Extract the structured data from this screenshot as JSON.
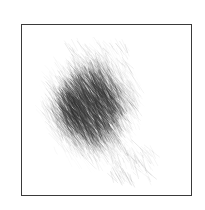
{
  "artwork": {
    "title": "Pencil Scribble Sketch",
    "medium": "graphite-hatching",
    "canvas": {
      "width": 205,
      "height": 210,
      "background_color": "#ffffff"
    },
    "frame": {
      "x": 21,
      "y": 24,
      "width": 171,
      "height": 172,
      "border_width": 1,
      "border_color": "#3a3a3a",
      "fill_color": "#ffffff"
    },
    "scribble": {
      "name": "diagonal-hatch-mass",
      "stroke_color": "#2e2e2e",
      "darkest_value": "#4a4a4a",
      "lightest_value": "#f2f2f2",
      "stroke_angle_degrees": 58,
      "stroke_count": 2600,
      "stroke_length_min": 5,
      "stroke_length_max": 26,
      "stroke_width": 0.45,
      "bounds": {
        "x_min": 42,
        "x_max": 152,
        "y_min": 44,
        "y_max": 180
      },
      "core": {
        "center_x": 88,
        "center_y": 108,
        "radius_x": 36,
        "radius_y": 46,
        "rotation_degrees": 28
      },
      "density_nodes": [
        {
          "x": 84,
          "y": 100,
          "radius": 30,
          "weight": 1.0
        },
        {
          "x": 74,
          "y": 114,
          "radius": 22,
          "weight": 0.95
        },
        {
          "x": 100,
          "y": 88,
          "radius": 26,
          "weight": 0.72
        },
        {
          "x": 110,
          "y": 118,
          "radius": 26,
          "weight": 0.66
        },
        {
          "x": 96,
          "y": 140,
          "radius": 24,
          "weight": 0.58
        },
        {
          "x": 120,
          "y": 146,
          "radius": 20,
          "weight": 0.42
        },
        {
          "x": 92,
          "y": 66,
          "radius": 22,
          "weight": 0.36
        },
        {
          "x": 124,
          "y": 96,
          "radius": 22,
          "weight": 0.34
        },
        {
          "x": 136,
          "y": 132,
          "radius": 16,
          "weight": 0.24
        },
        {
          "x": 138,
          "y": 164,
          "radius": 14,
          "weight": 0.16
        },
        {
          "x": 62,
          "y": 88,
          "radius": 16,
          "weight": 0.3
        },
        {
          "x": 108,
          "y": 162,
          "radius": 16,
          "weight": 0.2
        }
      ],
      "random_seed": 20147
    }
  }
}
